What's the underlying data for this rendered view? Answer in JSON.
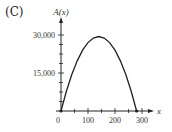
{
  "panel": {
    "label": "(C)"
  },
  "chart_data": {
    "type": "line",
    "title": "",
    "xlabel": "x",
    "ylabel": "A(x)",
    "function": "A(x) = 1.5x(280 - x)",
    "x": [
      0,
      20,
      40,
      60,
      80,
      100,
      120,
      140,
      160,
      180,
      200,
      220,
      240,
      260,
      280
    ],
    "values": [
      0,
      7800,
      14400,
      19800,
      24000,
      27000,
      28800,
      29400,
      28800,
      27000,
      24000,
      19800,
      14400,
      7800,
      0
    ],
    "endpoints": [
      [
        0,
        0
      ],
      [
        280,
        0
      ]
    ],
    "xlim": [
      0,
      320
    ],
    "ylim": [
      0,
      32000
    ],
    "x_ticks": [
      0,
      100,
      200,
      300
    ],
    "x_tick_labels": [
      "0",
      "100",
      "200",
      "300"
    ],
    "y_ticks": [
      15000,
      30000
    ],
    "y_tick_labels": [
      "15,000",
      "30,000"
    ],
    "grid": false,
    "legend": null
  },
  "axes": {
    "x_label": "x",
    "y_label": "A(x)",
    "x_tick_labels": [
      "0",
      "100",
      "200",
      "300"
    ],
    "y_tick_labels": [
      "15,000",
      "30,000"
    ]
  }
}
